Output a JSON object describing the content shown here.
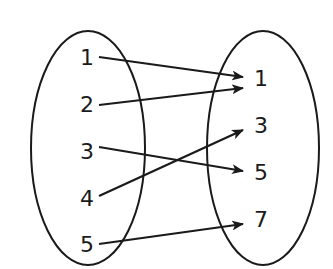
{
  "diagram": {
    "type": "mapping",
    "domain": {
      "values": [
        "1",
        "2",
        "3",
        "4",
        "5"
      ],
      "positions": [
        [
          87,
          59
        ],
        [
          87,
          106
        ],
        [
          87,
          153
        ],
        [
          87,
          200
        ],
        [
          87,
          246
        ]
      ],
      "ellipse": {
        "cx": 88,
        "cy": 148,
        "rx": 57,
        "ry": 117
      }
    },
    "range": {
      "values": [
        "1",
        "3",
        "5",
        "7"
      ],
      "positions": [
        [
          261,
          80
        ],
        [
          261,
          127
        ],
        [
          261,
          174
        ],
        [
          261,
          221
        ]
      ],
      "ellipse": {
        "cx": 263,
        "cy": 148,
        "rx": 56,
        "ry": 117
      }
    },
    "mappings": [
      {
        "from": "1",
        "to": "1",
        "x1": 99,
        "y1": 57,
        "x2": 243,
        "y2": 77
      },
      {
        "from": "2",
        "to": "1",
        "x1": 99,
        "y1": 105,
        "x2": 243,
        "y2": 88
      },
      {
        "from": "3",
        "to": "5",
        "x1": 99,
        "y1": 147,
        "x2": 243,
        "y2": 171
      },
      {
        "from": "4",
        "to": "3",
        "x1": 99,
        "y1": 196,
        "x2": 243,
        "y2": 130
      },
      {
        "from": "5",
        "to": "7",
        "x1": 99,
        "y1": 244,
        "x2": 243,
        "y2": 224
      }
    ],
    "stroke_color": "#1a1a1a"
  }
}
